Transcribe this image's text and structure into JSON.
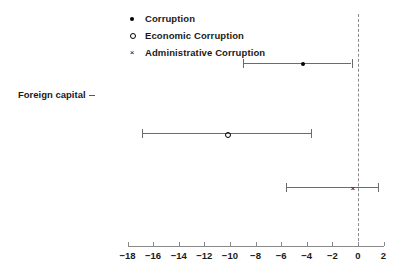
{
  "chart_data": {
    "type": "scatter",
    "title": "",
    "subtitle": "",
    "xlabel": "",
    "ylabel": "Foreign capital",
    "xlim": [
      -18,
      2
    ],
    "ylim": [
      0,
      1
    ],
    "grid": false,
    "legend_position": "top-left",
    "zero_reference_line": 0,
    "orientation": "horizontal",
    "plot_style": "coefficient-plot",
    "categories": [
      "Foreign capital"
    ],
    "xticks": [
      -18,
      -16,
      -14,
      -12,
      -10,
      -8,
      -6,
      -4,
      -2,
      0,
      2
    ],
    "xticklabels": [
      "-18",
      "-16",
      "-14",
      "-12",
      "-10",
      "-8",
      "-6",
      "-4",
      "-2",
      "0",
      "2"
    ],
    "series": [
      {
        "name": "Corruption",
        "marker": "filled-circle",
        "estimate": -4.3,
        "ci_low": -9.0,
        "ci_high": -0.5,
        "values": [
          -4.3
        ]
      },
      {
        "name": "Economic Corruption",
        "marker": "open-circle",
        "estimate": -10.2,
        "ci_low": -16.9,
        "ci_high": -3.7,
        "values": [
          -10.2
        ]
      },
      {
        "name": "Administrative Corruption",
        "marker": "cross",
        "estimate": -0.4,
        "ci_low": -5.6,
        "ci_high": 1.6,
        "values": [
          -0.4
        ]
      }
    ]
  },
  "legend": {
    "items": [
      {
        "label": "Corruption",
        "marker": "filled-circle"
      },
      {
        "label": "Economic Corruption",
        "marker": "open-circle"
      },
      {
        "label": "Administrative Corruption",
        "marker": "cross"
      }
    ]
  },
  "axis": {
    "y_label": "Foreign capital"
  },
  "colors": {
    "marker": "#000000",
    "line": "#6b6b6b",
    "axis": "#8a8a8a",
    "zero_line": "#8a8a8a",
    "text": "#1a1a1a",
    "background": "#ffffff"
  }
}
